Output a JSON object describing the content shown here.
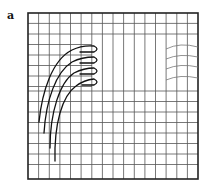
{
  "panel": {
    "label": "a"
  },
  "figure": {
    "frame": {
      "x": 28,
      "y": 13,
      "width": 170,
      "height": 166
    },
    "grid": {
      "columns": 16,
      "rows": 16,
      "line_color": "#555555",
      "frame_color": "#222222"
    },
    "dark_curves": {
      "count": 4,
      "color": "#111111"
    },
    "faint_curves": {
      "count": 4,
      "color": "#777777"
    }
  }
}
